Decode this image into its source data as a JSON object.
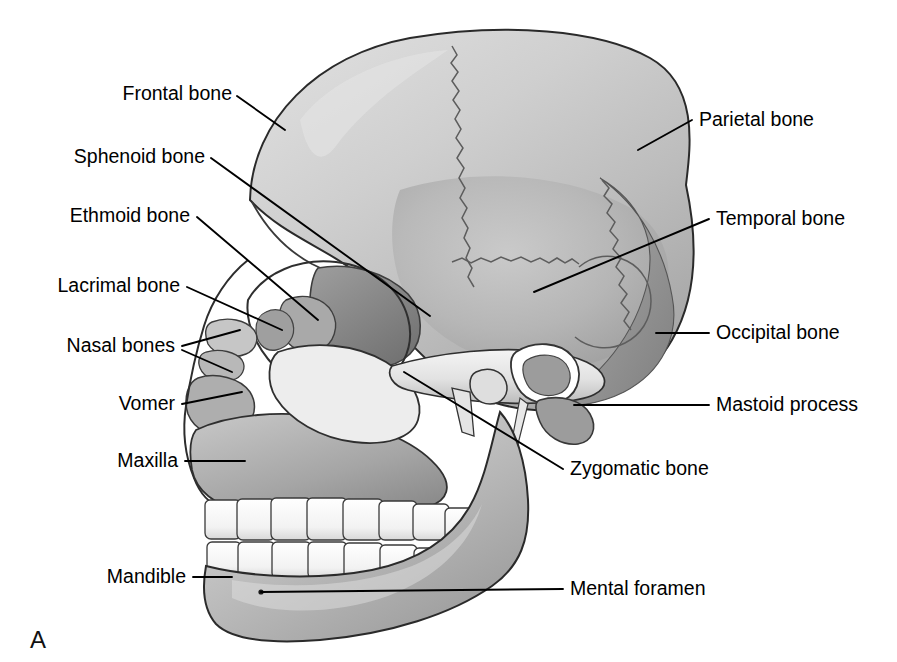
{
  "figure": {
    "panel_label": "A",
    "background_color": "#ffffff",
    "ink_color": "#000000"
  },
  "labels_left": [
    {
      "text": "Frontal bone",
      "x": 232,
      "y": 100
    },
    {
      "text": "Sphenoid bone",
      "x": 205,
      "y": 163
    },
    {
      "text": "Ethmoid bone",
      "x": 190,
      "y": 222
    },
    {
      "text": "Lacrimal bone",
      "x": 180,
      "y": 292
    },
    {
      "text": "Nasal bones",
      "x": 175,
      "y": 352
    },
    {
      "text": "Vomer",
      "x": 175,
      "y": 410
    },
    {
      "text": "Maxilla",
      "x": 178,
      "y": 467
    },
    {
      "text": "Mandible",
      "x": 186,
      "y": 583
    }
  ],
  "labels_right": [
    {
      "text": "Parietal bone",
      "x": 699,
      "y": 126
    },
    {
      "text": "Temporal bone",
      "x": 716,
      "y": 225
    },
    {
      "text": "Occipital bone",
      "x": 716,
      "y": 339
    },
    {
      "text": "Mastoid process",
      "x": 716,
      "y": 411
    },
    {
      "text": "Zygomatic bone",
      "x": 570,
      "y": 475
    },
    {
      "text": "Mental foramen",
      "x": 570,
      "y": 595
    }
  ],
  "palette": {
    "cranium_light": "#d2d2d2",
    "cranium_mid": "#bcbcbc",
    "cranium_shadow": "#9e9e9e",
    "occipital_dark": "#8e8e8e",
    "face_mid": "#b0b0b0",
    "face_shadow": "#8a8a8a",
    "teeth": "#fdfdfd",
    "highlight": "#efefef",
    "suture_line": "#5d5d5d",
    "outline": "#2a2a2a"
  }
}
